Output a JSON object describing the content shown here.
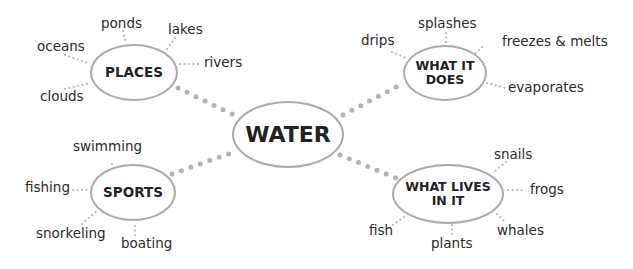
{
  "center": {
    "label": "WATER"
  },
  "branches": {
    "places": {
      "label": "PLACES",
      "items": [
        "ponds",
        "lakes",
        "oceans",
        "rivers",
        "clouds"
      ]
    },
    "what_it_does": {
      "label": "WHAT IT DOES",
      "items": [
        "splashes",
        "drips",
        "freezes & melts",
        "evaporates"
      ]
    },
    "sports": {
      "label": "SPORTS",
      "items": [
        "swimming",
        "fishing",
        "snorkeling",
        "boating"
      ]
    },
    "what_lives_in_it": {
      "label": "WHAT LIVES IN IT",
      "items": [
        "snails",
        "frogs",
        "fish",
        "plants",
        "whales"
      ]
    }
  },
  "colors": {
    "node_border": "#a9a9a9",
    "connector": "#b0b0b0",
    "text": "#222222"
  }
}
